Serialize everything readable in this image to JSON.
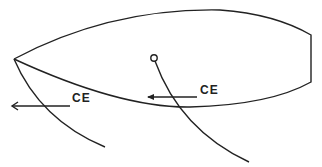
{
  "diagram": {
    "labels": [
      {
        "id": "ce-front",
        "text": "CE"
      },
      {
        "id": "ce-main",
        "text": "CE"
      }
    ],
    "stroke_color": "#222222",
    "background": "#ffffff"
  }
}
